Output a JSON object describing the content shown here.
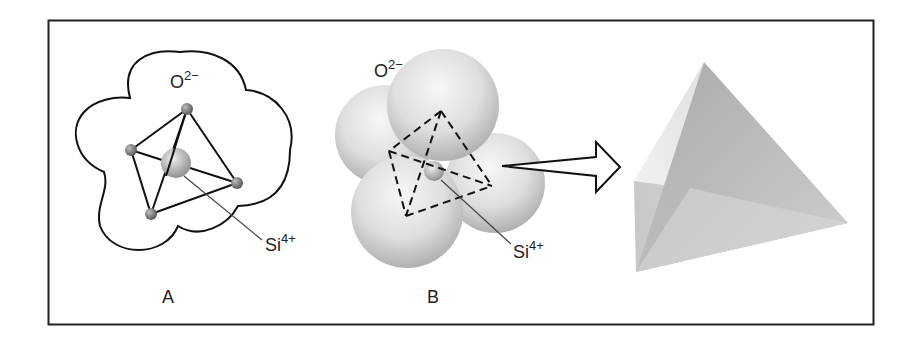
{
  "figure": {
    "panels": [
      {
        "id": "A",
        "caption": "A",
        "oxygen_label": "O",
        "oxygen_charge": "2−",
        "silicon_label": "Si",
        "silicon_charge": "4+"
      },
      {
        "id": "B",
        "caption": "B",
        "oxygen_label": "O",
        "oxygen_charge": "2−",
        "silicon_label": "Si",
        "silicon_charge": "4+"
      },
      {
        "id": "C",
        "caption": "",
        "description": "solid tetrahedron"
      }
    ],
    "arrow": "hollow-right-arrow",
    "colors": {
      "frame": "#222222",
      "line": "#1a1a1a",
      "sphere_light": "#f2f2f2",
      "sphere_dark": "#9a9a9a"
    }
  }
}
